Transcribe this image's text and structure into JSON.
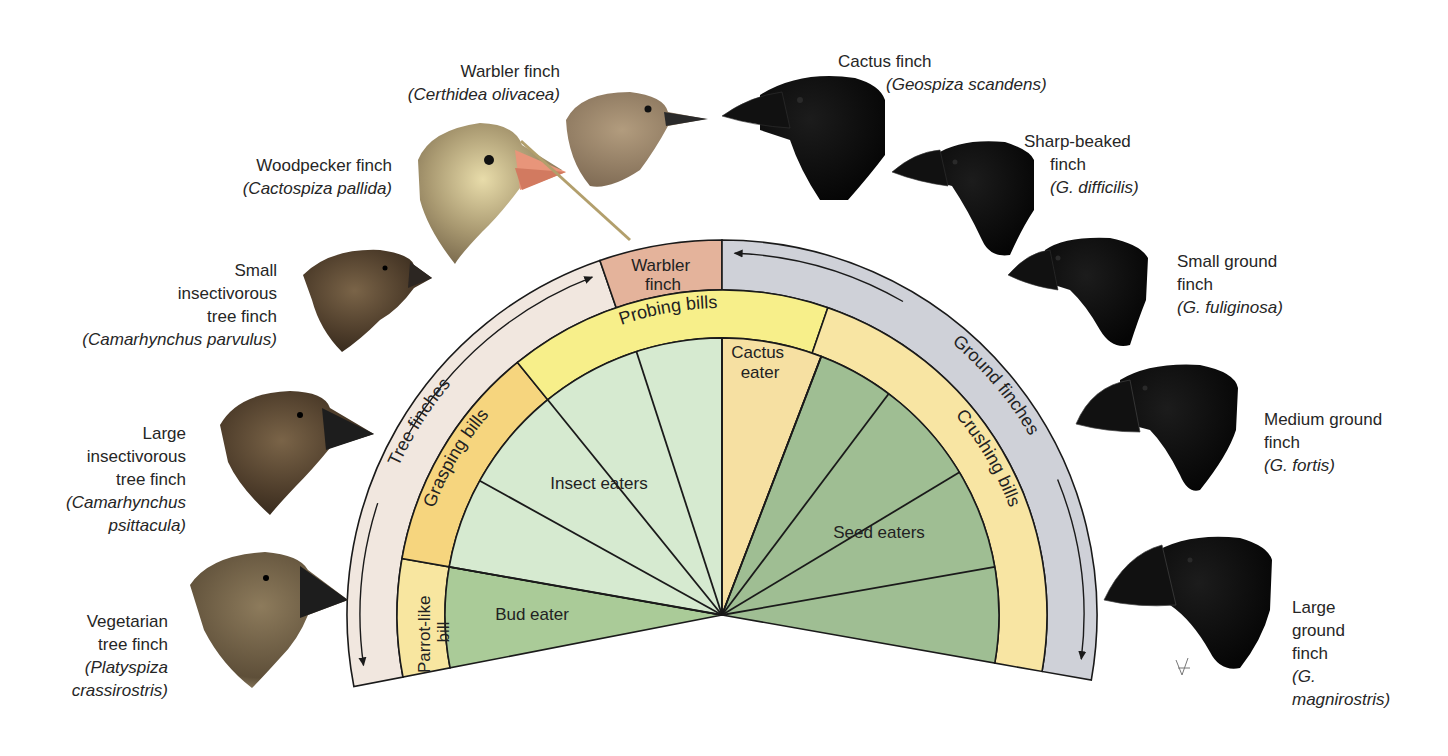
{
  "figure": {
    "center": {
      "x": 722,
      "y": 615
    },
    "radii": {
      "inner": 277,
      "bill_band": 325,
      "group_band": 375
    },
    "colors": {
      "tree_finch_band": "#f1e7df",
      "ground_finch_band": "#cfd1d8",
      "warbler_band": "#e4b39b",
      "probing_band": "#f7ef8a",
      "grasping_band": "#f6d57e",
      "parrot_band": "#f8e6a0",
      "crushing_band": "#f8e5a3",
      "insect_eaters": "#d6ead0",
      "bud_eater": "#aacb98",
      "seed_eaters": "#9fbe93",
      "cactus_eater": "#f6e0a2",
      "outline": "#1a1a1a"
    },
    "group_band": [
      {
        "id": "tree-finches",
        "label": "Tree finches",
        "start": 109,
        "end": 191
      },
      {
        "id": "warbler-finch",
        "label": "Warbler finch",
        "start": 90,
        "end": 109
      },
      {
        "id": "ground-finches",
        "label": "Ground finches",
        "start": -10,
        "end": 90
      }
    ],
    "bill_band": [
      {
        "id": "parrot-like-bill",
        "label": "Parrot-like bill",
        "start": 170,
        "end": 191
      },
      {
        "id": "grasping-bills",
        "label": "Grasping bills",
        "start": 129,
        "end": 170
      },
      {
        "id": "probing-bills",
        "label": "Probing bills",
        "start": 71,
        "end": 129
      },
      {
        "id": "crushing-bills",
        "label": "Crushing bills",
        "start": -10,
        "end": 71
      }
    ],
    "diet_wedges": [
      {
        "id": "bud-eater",
        "label": "Bud eater",
        "start": 170,
        "end": 191
      },
      {
        "id": "insect-eaters",
        "label": "Insect eaters",
        "start": 90,
        "end": 170
      },
      {
        "id": "cactus-eater",
        "label": "Cactus eater",
        "start": 69,
        "end": 90
      },
      {
        "id": "seed-eaters",
        "label": "Seed eaters",
        "start": -10,
        "end": 69
      }
    ],
    "radial_lines": [
      170,
      151,
      129,
      108,
      90,
      69,
      53,
      31,
      10
    ],
    "band_labels": {
      "warbler_finch": [
        "Warbler",
        "finch"
      ],
      "probing_bills": "Probing bills",
      "grasping_bills": "Grasping bills",
      "parrot_like_bill": [
        "Parrot-like",
        "bill"
      ],
      "crushing_bills": "Crushing bills",
      "tree_finches": "Tree finches",
      "ground_finches": "Ground finches",
      "cactus_eater": [
        "Cactus",
        "eater"
      ],
      "insect_eaters": "Insect eaters",
      "seed_eaters": "Seed eaters",
      "bud_eater": "Bud eater"
    }
  },
  "species": {
    "warbler": {
      "common": "Warbler finch",
      "scientific": "(Certhidea olivacea)"
    },
    "woodpecker": {
      "common": "Woodpecker finch",
      "scientific": "(Cactospiza pallida)"
    },
    "small_insectivorous": {
      "common": [
        "Small",
        "insectivorous",
        "tree finch"
      ],
      "scientific": "(Camarhynchus parvulus)"
    },
    "large_insectivorous": {
      "common": [
        "Large",
        "insectivorous",
        "tree finch"
      ],
      "scientific": [
        "(Camarhynchus",
        "psittacula)"
      ]
    },
    "vegetarian": {
      "common": [
        "Vegetarian",
        "tree finch"
      ],
      "scientific": [
        "(Platyspiza",
        "crassirostris)"
      ]
    },
    "cactus": {
      "common": "Cactus finch",
      "scientific": "(Geospiza scandens)"
    },
    "sharp_beaked": {
      "common": [
        "Sharp-beaked",
        "finch"
      ],
      "scientific": "(G. difficilis)"
    },
    "small_ground": {
      "common": [
        "Small ground",
        "finch"
      ],
      "scientific": "(G. fuliginosa)"
    },
    "medium_ground": {
      "common": [
        "Medium ground",
        "finch"
      ],
      "scientific": "(G. fortis)"
    },
    "large_ground": {
      "common": [
        "Large",
        "ground",
        "finch"
      ],
      "scientific": [
        "(G.",
        "magnirostris)"
      ]
    }
  }
}
